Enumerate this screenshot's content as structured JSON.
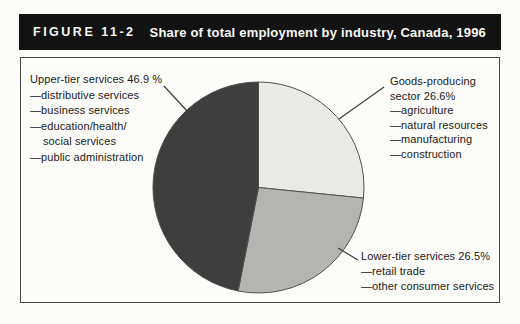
{
  "figure": {
    "number": "FIGURE 11-2",
    "title": "Share of total employment by industry, Canada, 1996"
  },
  "chart_data": {
    "type": "pie",
    "title": "Share of total employment by industry, Canada, 1996",
    "start_angle_deg": -90,
    "direction": "clockwise",
    "outline_color": "#515151",
    "slices": [
      {
        "id": "goods-producing-sector",
        "label": "Goods-producing sector",
        "value": 26.6,
        "color": "#e9e9e6"
      },
      {
        "id": "lower-tier-services",
        "label": "Lower-tier services",
        "value": 26.5,
        "color": "#b4b4b1"
      },
      {
        "id": "upper-tier-services",
        "label": "Upper-tier services",
        "value": 46.9,
        "color": "#3e3e3e"
      }
    ],
    "callouts": {
      "upper_tier": {
        "lines": [
          "Upper-tier services 46.9 %",
          "—distributive services",
          "—business services",
          "—education/health/",
          "social services",
          "—public administration"
        ]
      },
      "goods_producing": {
        "lines": [
          "Goods-producing",
          "sector 26.6%",
          "—agriculture",
          "—natural resources",
          "—manufacturing",
          "—construction"
        ]
      },
      "lower_tier": {
        "lines": [
          "Lower-tier services 26.5%",
          "—retail trade",
          "—other consumer services"
        ]
      }
    }
  },
  "colors": {
    "title_bar_bg": "#131313",
    "title_bar_text": "#f7f7f4",
    "box_border": "#484848",
    "background": "#fcfcf9",
    "leader_line": "#3d3d3d",
    "callout_text": "#212121"
  }
}
